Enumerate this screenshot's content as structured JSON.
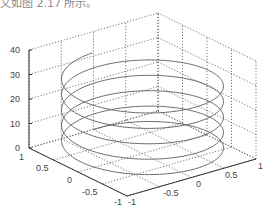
{
  "caption": "文如图 2.17 所示。",
  "chart_data": {
    "type": "line3d",
    "title": "",
    "series": [
      {
        "name": "helix",
        "x_expr": "sin(t)",
        "y_expr": "cos(t)",
        "z_expr": "t",
        "t_start": 0,
        "t_end": 31.4159,
        "t_step": 0.0628,
        "color": "#6e6e6e"
      }
    ],
    "xlim": [
      -1,
      1
    ],
    "ylim": [
      -1,
      1
    ],
    "zlim": [
      0,
      40
    ],
    "x_ticks": [
      "-1",
      "-0.5",
      "0",
      "0.5",
      "1"
    ],
    "y_ticks": [
      "1",
      "0.5",
      "0",
      "-0.5",
      "-1"
    ],
    "z_ticks": [
      "0",
      "10",
      "20",
      "30",
      "40"
    ],
    "xlabel": "",
    "ylabel": "",
    "zlabel": "",
    "grid": true,
    "grid_style": "dotted",
    "legend": null
  },
  "labels": {
    "z": [
      "0",
      "10",
      "20",
      "30",
      "40"
    ],
    "y": [
      "1",
      "0.5",
      "0",
      "-0.5",
      "-1"
    ],
    "x": [
      "-1",
      "-0.5",
      "0",
      "0.5",
      "1"
    ]
  }
}
